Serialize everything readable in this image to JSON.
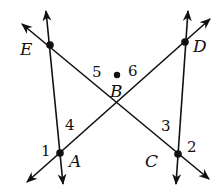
{
  "diagram": {
    "type": "geometry-intersecting-lines",
    "points": [
      {
        "name": "E",
        "x": 50,
        "y": 45,
        "label_x": 20,
        "label_y": 55
      },
      {
        "name": "D",
        "x": 185,
        "y": 42,
        "label_x": 193,
        "label_y": 52
      },
      {
        "name": "B",
        "x": 117,
        "y": 75,
        "label_x": 110,
        "label_y": 97
      },
      {
        "name": "A",
        "x": 60,
        "y": 153,
        "label_x": 69,
        "label_y": 167
      },
      {
        "name": "C",
        "x": 178,
        "y": 154,
        "label_x": 145,
        "label_y": 167
      }
    ],
    "angle_labels": [
      {
        "name": "1",
        "x": 41,
        "y": 156
      },
      {
        "name": "2",
        "x": 187,
        "y": 152
      },
      {
        "name": "3",
        "x": 161,
        "y": 131
      },
      {
        "name": "4",
        "x": 65,
        "y": 130
      },
      {
        "name": "5",
        "x": 92,
        "y": 77
      },
      {
        "name": "6",
        "x": 128,
        "y": 76
      }
    ],
    "lines": [
      {
        "name": "line-EC",
        "x1": 22,
        "y1": 24,
        "x2": 209,
        "y2": 179
      },
      {
        "name": "line-AD",
        "x1": 27,
        "y1": 182,
        "x2": 210,
        "y2": 19
      },
      {
        "name": "line-EA",
        "x1": 46,
        "y1": 11,
        "x2": 63,
        "y2": 184
      },
      {
        "name": "line-DC",
        "x1": 188,
        "y1": 11,
        "x2": 176,
        "y2": 184
      }
    ],
    "colors": {
      "stroke": "#111111",
      "background": "#ffffff"
    }
  }
}
